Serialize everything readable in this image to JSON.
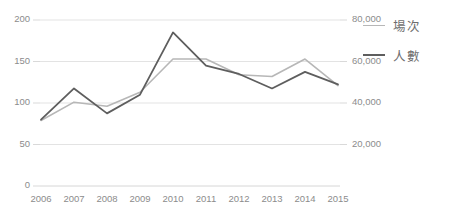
{
  "chart_data": {
    "type": "line",
    "title": "",
    "xlabel": "",
    "ylabel": "",
    "grid": true,
    "legend_position": "right",
    "categories": [
      "2006",
      "2007",
      "2008",
      "2009",
      "2010",
      "2011",
      "2012",
      "2013",
      "2014",
      "2015"
    ],
    "axes": {
      "left": {
        "label": "",
        "ylim": [
          0,
          200
        ],
        "ticks": [
          0,
          50,
          100,
          150,
          200
        ],
        "tick_labels": [
          "0",
          "50",
          "100",
          "150",
          "200"
        ]
      },
      "right": {
        "label": "",
        "ylim": [
          0,
          100000
        ],
        "ticks": [
          20000,
          40000,
          60000,
          80000
        ],
        "tick_labels": [
          "20,000",
          "40,000",
          "60,000",
          "80,000"
        ]
      }
    },
    "series": [
      {
        "name": "場次",
        "axis": "left",
        "color": "#b7b7b7",
        "values": [
          79,
          101,
          96,
          113,
          153,
          153,
          134,
          132,
          153,
          121
        ]
      },
      {
        "name": "人數",
        "axis": "right",
        "color": "#5e5e5e",
        "values": [
          32000,
          47000,
          35000,
          44000,
          74000,
          58000,
          54000,
          47000,
          55000,
          49000
        ]
      }
    ]
  },
  "legend": {
    "items": [
      {
        "label": "場次"
      },
      {
        "label": "人數"
      }
    ]
  }
}
